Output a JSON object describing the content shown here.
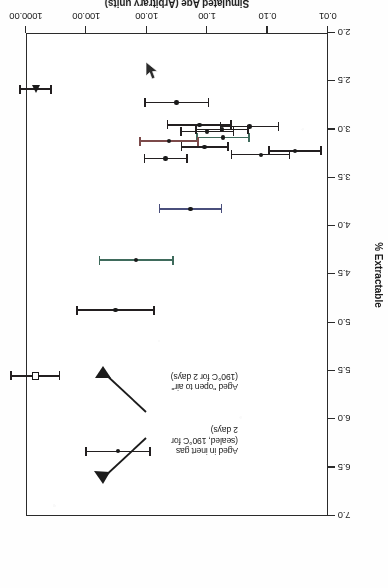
{
  "figure": {
    "rotation_degrees": 180,
    "marker_legend": {
      "open_square": "Aged in inert gas (sealed, 190°C for 2 days)",
      "filled_triangle": "Aged \"open to air\" (190°C for 2 days)",
      "filled_circle": "Naturally aged samples"
    }
  },
  "annotations": [
    {
      "name": "inert-gas-annotation",
      "text": "Aged in inert gas\n(sealed, 190°C for\n2 days)"
    },
    {
      "name": "open-to-air-annotation",
      "text": "Aged \"open to air\"\n(190°C for 2 days)"
    }
  ],
  "chart_data": {
    "type": "scatter",
    "title": "",
    "xlabel": "Simulated Age (Arbitrary units)",
    "ylabel": "% Extractable",
    "xscale": "log",
    "xlim": [
      0.01,
      1000.0
    ],
    "ylim": [
      2.0,
      7.0
    ],
    "grid": false,
    "legend_position": "none",
    "xticks": [
      {
        "value": 0.01,
        "label": "0.01"
      },
      {
        "value": 0.1,
        "label": "0.10"
      },
      {
        "value": 1.0,
        "label": "1.00"
      },
      {
        "value": 10.0,
        "label": "10.00"
      },
      {
        "value": 100.0,
        "label": "100.00"
      },
      {
        "value": 1000.0,
        "label": "1000.00"
      }
    ],
    "yticks": [
      {
        "value": 2.0,
        "label": "2.0"
      },
      {
        "value": 2.5,
        "label": "2.5"
      },
      {
        "value": 3.0,
        "label": "3.0"
      },
      {
        "value": 3.5,
        "label": "3.5"
      },
      {
        "value": 4.0,
        "label": "4.0"
      },
      {
        "value": 4.5,
        "label": "4.5"
      },
      {
        "value": 5.0,
        "label": "5.0"
      },
      {
        "value": 5.5,
        "label": "5.5"
      },
      {
        "value": 6.0,
        "label": "6.0"
      },
      {
        "value": 6.5,
        "label": "6.5"
      },
      {
        "value": 7.0,
        "label": "7.0"
      }
    ],
    "points": [
      {
        "x": 0.035,
        "y": 3.22,
        "yerr": 0.27,
        "marker": "circle",
        "tint": ""
      },
      {
        "x": 0.13,
        "y": 3.26,
        "yerr": 0.3,
        "marker": "circle",
        "tint": ""
      },
      {
        "x": 0.2,
        "y": 2.97,
        "yerr": 0.3,
        "marker": "circle",
        "tint": ""
      },
      {
        "x": 0.55,
        "y": 3.08,
        "yerr": 0.27,
        "marker": "circle",
        "tint": "green"
      },
      {
        "x": 0.57,
        "y": 3.0,
        "yerr": 0.27,
        "marker": "circle",
        "tint": ""
      },
      {
        "x": 1.0,
        "y": 3.02,
        "yerr": 0.27,
        "marker": "circle",
        "tint": ""
      },
      {
        "x": 1.1,
        "y": 3.18,
        "yerr": 0.24,
        "marker": "circle",
        "tint": ""
      },
      {
        "x": 1.35,
        "y": 2.95,
        "yerr": 0.33,
        "marker": "circle",
        "tint": ""
      },
      {
        "x": 1.9,
        "y": 3.82,
        "yerr": 0.32,
        "marker": "circle",
        "tint": "blue"
      },
      {
        "x": 3.2,
        "y": 2.72,
        "yerr": 0.33,
        "marker": "circle",
        "tint": ""
      },
      {
        "x": 4.3,
        "y": 3.12,
        "yerr": 0.3,
        "marker": "circle",
        "tint": "red"
      },
      {
        "x": 4.9,
        "y": 3.3,
        "yerr": 0.22,
        "marker": "circle",
        "tint": ""
      },
      {
        "x": 15.0,
        "y": 4.35,
        "yerr": 0.38,
        "marker": "circle",
        "tint": "green"
      },
      {
        "x": 33.0,
        "y": 4.87,
        "yerr": 0.4,
        "marker": "circle",
        "tint": ""
      },
      {
        "x": 30.0,
        "y": 6.33,
        "yerr": 0.33,
        "marker": "circle",
        "tint": ""
      },
      {
        "x": 700.0,
        "y": 5.55,
        "yerr": 0.25,
        "marker": "square",
        "tint": ""
      },
      {
        "x": 700.0,
        "y": 2.58,
        "yerr": 0.16,
        "marker": "triangle",
        "tint": ""
      }
    ]
  }
}
